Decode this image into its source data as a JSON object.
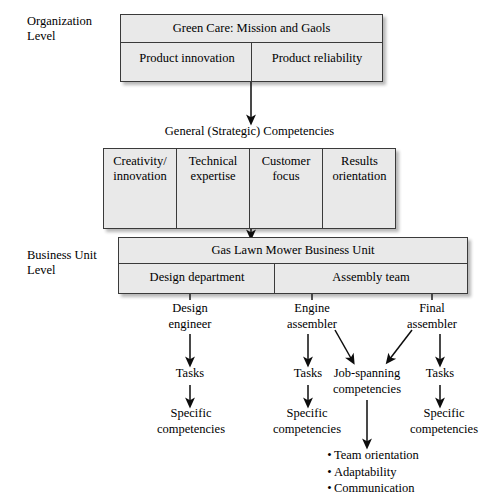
{
  "levels": {
    "organization": "Organization\nLevel",
    "organization_line1": "Organization",
    "organization_line2": "Level",
    "business_unit_line1": "Business Unit",
    "business_unit_line2": "Level"
  },
  "organization_box": {
    "title": "Green Care: Mission and Gaols",
    "cells": [
      "Product innovation",
      "Product reliability"
    ]
  },
  "general_competencies": {
    "title": "General (Strategic) Competencies",
    "cells": [
      "Creativity/\ninnovation",
      "Technical\nexpertise",
      "Customer\nfocus",
      "Results\norientation"
    ],
    "cell_lines": [
      {
        "l1": "Creativity/",
        "l2": "innovation"
      },
      {
        "l1": "Technical",
        "l2": "expertise"
      },
      {
        "l1": "Customer",
        "l2": "focus"
      },
      {
        "l1": "Results",
        "l2": "orientation"
      }
    ]
  },
  "business_unit_box": {
    "title": "Gas Lawn Mower Business Unit",
    "cells": [
      "Design department",
      "Assembly team"
    ]
  },
  "roles": [
    {
      "line1": "Design",
      "line2": "engineer"
    },
    {
      "line1": "Engine",
      "line2": "assembler"
    },
    {
      "line1": "Final",
      "line2": "assembler"
    }
  ],
  "tasks_label": "Tasks",
  "specific_competencies": {
    "line1": "Specific",
    "line2": "competencies"
  },
  "job_spanning": {
    "line1": "Job-spanning",
    "line2": "competencies"
  },
  "job_spanning_items": [
    "Team orientation",
    "Adaptability",
    "Communication"
  ],
  "bullet_glyph": "•",
  "colors": {
    "box_fill": "#e9e9e9",
    "box_border": "#3a3a3a",
    "text": "#000000",
    "background": "#ffffff",
    "arrow": "#0d0d0d"
  }
}
